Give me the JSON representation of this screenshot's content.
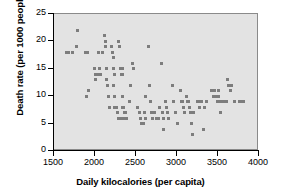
{
  "chart_data": {
    "type": "scatter",
    "title": "",
    "xlabel": "Daily kilocalories (per capita)",
    "ylabel": "Death rate (per 1000 people)",
    "xlim": [
      1500,
      4000
    ],
    "ylim": [
      0,
      25
    ],
    "xticks": [
      1500,
      2000,
      2500,
      3000,
      3500,
      4000
    ],
    "yticks": [
      0,
      5,
      10,
      15,
      20,
      25
    ],
    "xtick_labels": [
      "1500",
      "2000",
      "2500",
      "3000",
      "3500",
      "4000"
    ],
    "ytick_labels": [
      "0",
      "5",
      "10",
      "15",
      "20",
      "25"
    ],
    "grid": false,
    "legend": null,
    "marker": "square",
    "marker_color": "#7d7d7d",
    "plot_background": "#e3e3e3",
    "points": [
      [
        1650,
        18
      ],
      [
        1680,
        18
      ],
      [
        1720,
        18
      ],
      [
        1780,
        19
      ],
      [
        1790,
        22
      ],
      [
        1880,
        18
      ],
      [
        1900,
        18
      ],
      [
        1910,
        18
      ],
      [
        1900,
        10
      ],
      [
        1920,
        11
      ],
      [
        1990,
        15
      ],
      [
        2000,
        14
      ],
      [
        2010,
        14
      ],
      [
        2010,
        13
      ],
      [
        2030,
        14
      ],
      [
        2040,
        18
      ],
      [
        2060,
        15
      ],
      [
        2070,
        14
      ],
      [
        2090,
        18
      ],
      [
        2120,
        21
      ],
      [
        2130,
        20
      ],
      [
        2130,
        19
      ],
      [
        2140,
        15
      ],
      [
        2140,
        13
      ],
      [
        2150,
        12
      ],
      [
        2160,
        10
      ],
      [
        2170,
        10
      ],
      [
        2180,
        8
      ],
      [
        2200,
        19
      ],
      [
        2210,
        18
      ],
      [
        2220,
        17
      ],
      [
        2230,
        15
      ],
      [
        2240,
        14
      ],
      [
        2230,
        12
      ],
      [
        2240,
        10
      ],
      [
        2240,
        8
      ],
      [
        2250,
        8
      ],
      [
        2260,
        8
      ],
      [
        2270,
        7
      ],
      [
        2280,
        7
      ],
      [
        2290,
        6
      ],
      [
        2300,
        6
      ],
      [
        2290,
        20
      ],
      [
        2300,
        19
      ],
      [
        2310,
        15
      ],
      [
        2320,
        14
      ],
      [
        2330,
        15
      ],
      [
        2340,
        14
      ],
      [
        2330,
        10
      ],
      [
        2340,
        8
      ],
      [
        2350,
        8
      ],
      [
        2360,
        7
      ],
      [
        2370,
        7
      ],
      [
        2340,
        6
      ],
      [
        2360,
        6
      ],
      [
        2380,
        6
      ],
      [
        2420,
        9
      ],
      [
        2430,
        12
      ],
      [
        2460,
        16
      ],
      [
        2470,
        15
      ],
      [
        2520,
        8
      ],
      [
        2540,
        7
      ],
      [
        2550,
        6
      ],
      [
        2560,
        6
      ],
      [
        2570,
        5
      ],
      [
        2590,
        5
      ],
      [
        2600,
        7
      ],
      [
        2610,
        6
      ],
      [
        2620,
        10
      ],
      [
        2650,
        19
      ],
      [
        2660,
        12
      ],
      [
        2680,
        9
      ],
      [
        2690,
        7
      ],
      [
        2700,
        6
      ],
      [
        2730,
        7
      ],
      [
        2750,
        6
      ],
      [
        2770,
        6
      ],
      [
        2790,
        8
      ],
      [
        2810,
        16
      ],
      [
        2820,
        7
      ],
      [
        2830,
        6
      ],
      [
        2840,
        4
      ],
      [
        2860,
        9
      ],
      [
        2870,
        8
      ],
      [
        2880,
        7
      ],
      [
        2890,
        7
      ],
      [
        2900,
        6
      ],
      [
        2950,
        12
      ],
      [
        2960,
        9
      ],
      [
        2980,
        7
      ],
      [
        3000,
        5
      ],
      [
        3040,
        11
      ],
      [
        3060,
        9
      ],
      [
        3070,
        9
      ],
      [
        3080,
        8
      ],
      [
        3090,
        7
      ],
      [
        3110,
        10
      ],
      [
        3130,
        9
      ],
      [
        3140,
        9
      ],
      [
        3150,
        8
      ],
      [
        3160,
        7
      ],
      [
        3180,
        5
      ],
      [
        3190,
        3
      ],
      [
        3200,
        7
      ],
      [
        3250,
        9
      ],
      [
        3260,
        9
      ],
      [
        3270,
        8
      ],
      [
        3280,
        8
      ],
      [
        3300,
        9
      ],
      [
        3320,
        4
      ],
      [
        3340,
        8
      ],
      [
        3360,
        9
      ],
      [
        3420,
        11
      ],
      [
        3440,
        10
      ],
      [
        3460,
        11
      ],
      [
        3480,
        10
      ],
      [
        3490,
        9
      ],
      [
        3500,
        11
      ],
      [
        3510,
        10
      ],
      [
        3520,
        9
      ],
      [
        3530,
        7
      ],
      [
        3560,
        9
      ],
      [
        3580,
        9
      ],
      [
        3600,
        9
      ],
      [
        3610,
        13
      ],
      [
        3630,
        12
      ],
      [
        3650,
        11
      ],
      [
        3670,
        12
      ],
      [
        3700,
        9
      ],
      [
        3760,
        9
      ],
      [
        3790,
        9
      ],
      [
        3810,
        9
      ]
    ]
  }
}
